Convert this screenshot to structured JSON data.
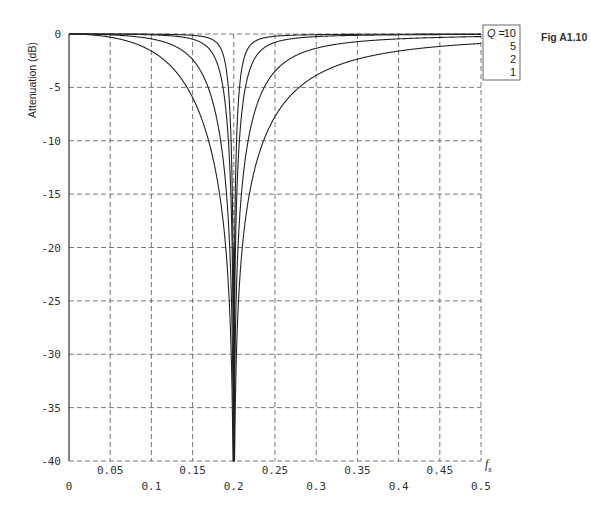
{
  "figure_label": "Fig A1.10",
  "chart_data": {
    "type": "line",
    "title": "",
    "xlabel": "f_s",
    "ylabel": "Attenuation (dB)",
    "xlim": [
      0,
      0.5
    ],
    "ylim": [
      -40,
      0
    ],
    "grid": true,
    "grid_style": "dashed",
    "legend_position": "top-right, outside plot",
    "notch_frequency": 0.2,
    "x_ticks_upper": [
      "0.05",
      "0.15",
      "0.25",
      "0.35",
      "0.45"
    ],
    "x_ticks_upper_values": [
      0.05,
      0.15,
      0.25,
      0.35,
      0.45
    ],
    "x_ticks_lower": [
      "0",
      "0.1",
      "0.2",
      "0.3",
      "0.4",
      "0.5"
    ],
    "x_ticks_lower_values": [
      0,
      0.1,
      0.2,
      0.3,
      0.4,
      0.5
    ],
    "y_ticks": [
      "0",
      "-5",
      "-10",
      "-15",
      "-20",
      "-25",
      "-30",
      "-35",
      "-40"
    ],
    "y_tick_values": [
      0,
      -5,
      -10,
      -15,
      -20,
      -25,
      -30,
      -35,
      -40
    ],
    "legend": {
      "title": "Q = 10",
      "entries": [
        "10",
        "5",
        "2",
        "1"
      ]
    },
    "series": [
      {
        "name": "Q = 10",
        "Q": 10,
        "x": [
          0.0,
          0.1,
          0.15,
          0.18,
          0.19,
          0.195,
          0.2,
          0.205,
          0.21,
          0.22,
          0.25,
          0.3,
          0.4,
          0.5
        ],
        "values": [
          0.0,
          -0.01,
          -0.06,
          -0.3,
          -1.0,
          -3.1,
          -40,
          -3.2,
          -1.1,
          -0.33,
          -0.06,
          -0.02,
          -0.01,
          -0.0
        ]
      },
      {
        "name": "Q = 5",
        "Q": 5,
        "x": [
          0.0,
          0.1,
          0.15,
          0.18,
          0.19,
          0.195,
          0.2,
          0.205,
          0.21,
          0.22,
          0.25,
          0.3,
          0.4,
          0.5
        ],
        "values": [
          0.0,
          -0.04,
          -0.23,
          -1.1,
          -3.1,
          -7.9,
          -40,
          -8.0,
          -3.3,
          -1.2,
          -0.24,
          -0.07,
          -0.02,
          -0.01
        ]
      },
      {
        "name": "Q = 2",
        "Q": 2,
        "x": [
          0.0,
          0.1,
          0.15,
          0.18,
          0.19,
          0.195,
          0.2,
          0.205,
          0.21,
          0.22,
          0.25,
          0.3,
          0.4,
          0.5
        ],
        "values": [
          0.0,
          -0.24,
          -1.4,
          -5.0,
          -10.3,
          -16.0,
          -40,
          -16.1,
          -10.6,
          -5.4,
          -1.5,
          -0.45,
          -0.12,
          -0.05
        ]
      },
      {
        "name": "Q = 1",
        "Q": 1,
        "x": [
          0.0,
          0.1,
          0.15,
          0.18,
          0.19,
          0.195,
          0.2,
          0.205,
          0.21,
          0.22,
          0.25,
          0.3,
          0.4,
          0.5
        ],
        "values": [
          0.0,
          -0.92,
          -4.2,
          -10.9,
          -16.3,
          -22.0,
          -40,
          -22.1,
          -16.5,
          -11.2,
          -4.8,
          -1.7,
          -0.5,
          -0.2
        ]
      }
    ]
  }
}
